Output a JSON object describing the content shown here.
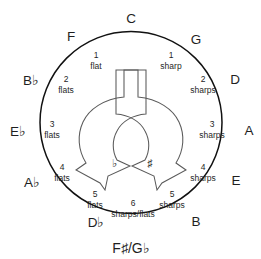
{
  "diagram": {
    "center": {
      "x": 131,
      "y": 122.5
    },
    "radius": 91,
    "ring_color": "#111111",
    "arrow_color": "#5a5a5a",
    "background_color": "#ffffff"
  },
  "outer_keys": [
    {
      "label": "C",
      "x": 131,
      "y": 18,
      "name": "key-c"
    },
    {
      "label": "G",
      "x": 196,
      "y": 39,
      "name": "key-g"
    },
    {
      "label": "D",
      "x": 235,
      "y": 79,
      "name": "key-d"
    },
    {
      "label": "A",
      "x": 249,
      "y": 130,
      "name": "key-a"
    },
    {
      "label": "E",
      "x": 236,
      "y": 180,
      "name": "key-e"
    },
    {
      "label": "B",
      "x": 196,
      "y": 221,
      "name": "key-b"
    },
    {
      "label": "D♭",
      "x": 96,
      "y": 222,
      "name": "key-d-flat"
    },
    {
      "label": "A♭",
      "x": 32,
      "y": 182,
      "name": "key-a-flat"
    },
    {
      "label": "E♭",
      "x": 18,
      "y": 131,
      "name": "key-e-flat"
    },
    {
      "label": "B♭",
      "x": 31,
      "y": 80,
      "name": "key-b-flat"
    },
    {
      "label": "F",
      "x": 71,
      "y": 36,
      "name": "key-f"
    }
  ],
  "bottom_key": {
    "label": "F♯/G♭",
    "x": 131,
    "y": 248,
    "name": "key-f-sharp-g-flat"
  },
  "inner_counts": [
    {
      "num": "1",
      "word": "flat",
      "x": 96,
      "y_num": 55,
      "y_word": 66,
      "name": "count-1-flat"
    },
    {
      "num": "2",
      "word": "flats",
      "x": 66,
      "y_num": 79,
      "y_word": 90,
      "name": "count-2-flats"
    },
    {
      "num": "3",
      "word": "flats",
      "x": 52,
      "y_num": 124,
      "y_word": 135,
      "name": "count-3-flats"
    },
    {
      "num": "4",
      "word": "flats",
      "x": 62,
      "y_num": 167,
      "y_word": 178,
      "name": "count-4-flats"
    },
    {
      "num": "5",
      "word": "flats",
      "x": 95,
      "y_num": 194,
      "y_word": 205,
      "name": "count-5-flats"
    },
    {
      "num": "1",
      "word": "sharp",
      "x": 171,
      "y_num": 55,
      "y_word": 66,
      "name": "count-1-sharp"
    },
    {
      "num": "2",
      "word": "sharps",
      "x": 203,
      "y_num": 79,
      "y_word": 90,
      "name": "count-2-sharps"
    },
    {
      "num": "3",
      "word": "sharps",
      "x": 212,
      "y_num": 124,
      "y_word": 135,
      "name": "count-3-sharps"
    },
    {
      "num": "4",
      "word": "sharps",
      "x": 203,
      "y_num": 167,
      "y_word": 178,
      "name": "count-4-sharps"
    },
    {
      "num": "5",
      "word": "sharps",
      "x": 172,
      "y_num": 194,
      "y_word": 205,
      "name": "count-5-sharps"
    }
  ],
  "bottom_count": {
    "num": "6",
    "word": "sharps/flats",
    "x": 133,
    "y_num": 203,
    "y_word": 214,
    "name": "count-6-sharps-flats"
  },
  "arrows": [
    {
      "name": "flats-direction-arrow",
      "side": "left",
      "symbol": "♭",
      "symbol_x": 114,
      "symbol_y": 163,
      "direction": "counterclockwise-descending"
    },
    {
      "name": "sharps-direction-arrow",
      "side": "right",
      "symbol": "♯",
      "symbol_x": 150,
      "symbol_y": 163,
      "direction": "clockwise-descending"
    }
  ]
}
